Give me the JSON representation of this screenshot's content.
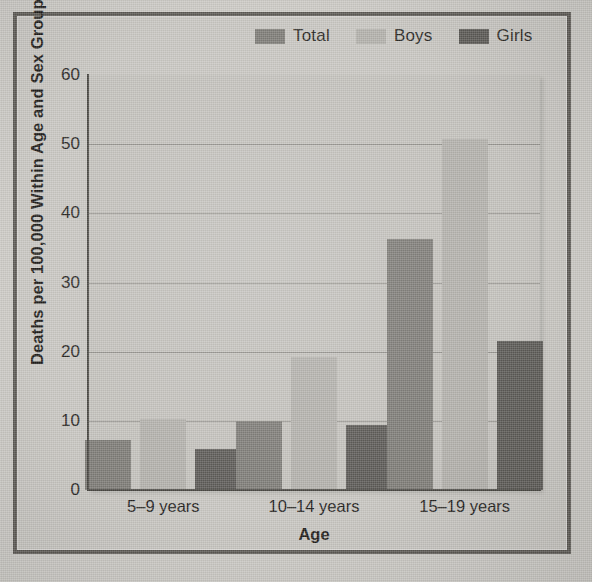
{
  "chart_data": {
    "type": "bar",
    "title": "",
    "xlabel": "Age",
    "ylabel": "Deaths per 100,000 Within Age and Sex Groups",
    "categories": [
      "5–9 years",
      "10–14 years",
      "15–19 years"
    ],
    "series": [
      {
        "name": "Total",
        "color": "#7e7c77",
        "values": [
          7.3,
          10.0,
          36.3
        ]
      },
      {
        "name": "Boys",
        "color": "#b3b1ac",
        "values": [
          10.3,
          19.2,
          50.7
        ]
      },
      {
        "name": "Girls",
        "color": "#5c5a56",
        "values": [
          6.0,
          9.4,
          21.5
        ]
      }
    ],
    "ylim": [
      0,
      60
    ],
    "yticks": [
      "0",
      "10",
      "20",
      "30",
      "40",
      "50",
      "60"
    ],
    "grid": true,
    "legend_position": "top-right"
  },
  "style": {
    "page_background": "#cdcbc6",
    "frame_border": "#5d5a55",
    "plot_background": "#c4c2bd",
    "axis_color": "#4a4843",
    "gridline_color": "#8b8883",
    "text_color": "#24221e"
  }
}
